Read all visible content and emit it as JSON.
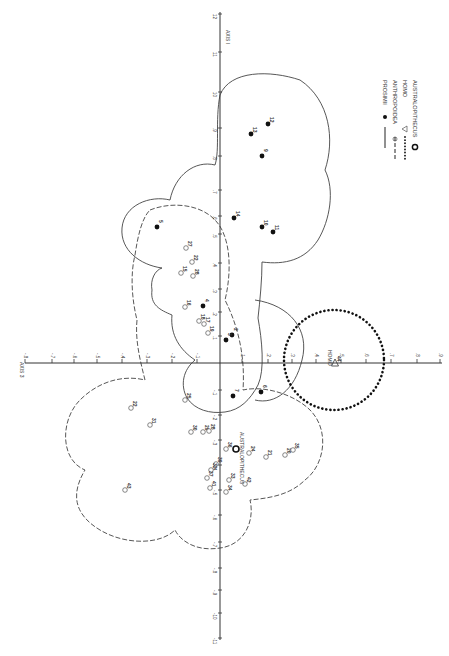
{
  "figure": {
    "axis_vertical_label": "AXIS I",
    "axis_horizontal_label": "AXIS 3",
    "vertical_axis_x": 220,
    "horizontal_axis_y": 363,
    "vertical_ticks": [
      {
        "label": "12",
        "y": 14
      },
      {
        "label": "11",
        "y": 52
      },
      {
        "label": "10",
        "y": 92
      },
      {
        "label": ".9",
        "y": 128
      },
      {
        "label": ".8",
        "y": 156
      },
      {
        "label": ".7",
        "y": 190
      },
      {
        "label": ".6",
        "y": 216
      },
      {
        "label": ".5",
        "y": 234
      },
      {
        "label": ".4",
        "y": 263
      },
      {
        "label": ".3",
        "y": 289
      },
      {
        "label": ".2",
        "y": 312
      },
      {
        "label": ".1",
        "y": 336
      },
      {
        "label": "-.1",
        "y": 390
      },
      {
        "label": "-.2",
        "y": 415
      },
      {
        "label": "-.3",
        "y": 440
      },
      {
        "label": "-.4",
        "y": 465
      },
      {
        "label": "-.5",
        "y": 490
      },
      {
        "label": "-.6",
        "y": 515
      },
      {
        "label": "-.7",
        "y": 542
      },
      {
        "label": "-.8",
        "y": 568
      },
      {
        "label": "-.9",
        "y": 590
      },
      {
        "label": "-10",
        "y": 613
      },
      {
        "label": "-11",
        "y": 638
      }
    ],
    "horizontal_ticks": [
      {
        "label": "-.8",
        "x": 25
      },
      {
        "label": "-.7",
        "x": 52
      },
      {
        "label": "-.6",
        "x": 74
      },
      {
        "label": "-.5",
        "x": 97
      },
      {
        "label": "-.4",
        "x": 122
      },
      {
        "label": "-.3",
        "x": 147
      },
      {
        "label": "-.2",
        "x": 172
      },
      {
        "label": "-.1",
        "x": 197
      },
      {
        "label": ".1",
        "x": 242
      },
      {
        "label": ".2",
        "x": 268
      },
      {
        "label": ".3",
        "x": 292
      },
      {
        "label": ".4",
        "x": 316
      },
      {
        "label": ".5",
        "x": 341
      },
      {
        "label": ".6",
        "x": 366
      },
      {
        "label": ".7",
        "x": 391
      },
      {
        "label": ".8",
        "x": 417
      },
      {
        "label": ".9",
        "x": 440
      }
    ],
    "legend": [
      {
        "label": "PROSIMII",
        "marker": "filled-circle",
        "line": "solid"
      },
      {
        "label": "ANTHROPOIDEA",
        "marker": "open-circle",
        "line": "dashed"
      },
      {
        "label": "HOMO",
        "marker": "open-triangle",
        "line": "dotted"
      },
      {
        "label": "AUSTRALOPITHECUS",
        "marker": "ringed-circle",
        "line": "none"
      }
    ],
    "homo_label": "HOMO",
    "australopithecus_label": "AUSTRALOPITHECUS",
    "points": [
      {
        "id": "13",
        "group": "prosimii",
        "x": 251,
        "y": 134
      },
      {
        "id": "12",
        "group": "prosimii",
        "x": 268,
        "y": 124
      },
      {
        "id": "9",
        "group": "prosimii",
        "x": 262,
        "y": 156
      },
      {
        "id": "14",
        "group": "prosimii",
        "x": 234,
        "y": 218
      },
      {
        "id": "10",
        "group": "prosimii",
        "x": 262,
        "y": 227
      },
      {
        "id": "11",
        "group": "prosimii",
        "x": 273,
        "y": 232
      },
      {
        "id": "5",
        "group": "prosimii",
        "x": 157,
        "y": 227
      },
      {
        "id": "4",
        "group": "prosimii",
        "x": 203,
        "y": 306
      },
      {
        "id": "2",
        "group": "prosimii",
        "x": 232,
        "y": 335
      },
      {
        "id": "3",
        "group": "prosimii",
        "x": 226,
        "y": 340
      },
      {
        "id": "7",
        "group": "prosimii",
        "x": 233,
        "y": 396
      },
      {
        "id": "6",
        "group": "prosimii",
        "x": 261,
        "y": 392
      },
      {
        "id": "27",
        "group": "anthropoidea",
        "x": 186,
        "y": 248
      },
      {
        "id": "22",
        "group": "anthropoidea",
        "x": 192,
        "y": 262
      },
      {
        "id": "15",
        "group": "anthropoidea",
        "x": 181,
        "y": 273
      },
      {
        "id": "28",
        "group": "anthropoidea",
        "x": 193,
        "y": 276
      },
      {
        "id": "16",
        "group": "anthropoidea",
        "x": 185,
        "y": 307
      },
      {
        "id": "18",
        "group": "anthropoidea",
        "x": 199,
        "y": 321
      },
      {
        "id": "17",
        "group": "anthropoidea",
        "x": 204,
        "y": 324
      },
      {
        "id": "19",
        "group": "anthropoidea",
        "x": 208,
        "y": 333
      },
      {
        "id": "25",
        "group": "anthropoidea",
        "x": 185,
        "y": 400
      },
      {
        "id": "30",
        "group": "anthropoidea",
        "x": 191,
        "y": 432
      },
      {
        "id": "29",
        "group": "anthropoidea",
        "x": 203,
        "y": 432
      },
      {
        "id": "28b",
        "label": "28",
        "group": "anthropoidea",
        "x": 209,
        "y": 431
      },
      {
        "id": "36",
        "group": "anthropoidea",
        "x": 226,
        "y": 449
      },
      {
        "id": "24",
        "group": "anthropoidea",
        "x": 249,
        "y": 453
      },
      {
        "id": "21",
        "group": "anthropoidea",
        "x": 266,
        "y": 457
      },
      {
        "id": "20",
        "group": "anthropoidea",
        "x": 285,
        "y": 455
      },
      {
        "id": "35",
        "group": "anthropoidea",
        "x": 293,
        "y": 450
      },
      {
        "id": "39",
        "group": "anthropoidea",
        "x": 216,
        "y": 464
      },
      {
        "id": "32",
        "group": "anthropoidea",
        "x": 211,
        "y": 470
      },
      {
        "id": "37",
        "group": "anthropoidea",
        "x": 207,
        "y": 478
      },
      {
        "id": "33",
        "group": "anthropoidea",
        "x": 229,
        "y": 480
      },
      {
        "id": "42",
        "group": "anthropoidea",
        "x": 245,
        "y": 484
      },
      {
        "id": "41",
        "group": "anthropoidea",
        "x": 210,
        "y": 488
      },
      {
        "id": "34",
        "group": "anthropoidea",
        "x": 226,
        "y": 492
      },
      {
        "id": "22b",
        "label": "22",
        "group": "anthropoidea",
        "x": 131,
        "y": 408
      },
      {
        "id": "31",
        "group": "anthropoidea",
        "x": 150,
        "y": 425
      },
      {
        "id": "43",
        "group": "anthropoidea",
        "x": 125,
        "y": 490
      },
      {
        "id": "44",
        "group": "homo",
        "x": 335,
        "y": 363
      },
      {
        "id": "A",
        "label": "",
        "group": "australopithecus",
        "x": 236,
        "y": 449
      }
    ]
  }
}
